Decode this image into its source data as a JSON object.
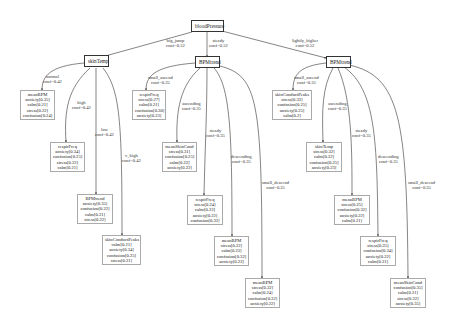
{
  "diagram": {
    "root": {
      "id": "n0",
      "label": "bloodPressure"
    },
    "internal_nodes": [
      {
        "id": "n1",
        "label": "skinTemp"
      },
      {
        "id": "n2",
        "label": "BPMtrend"
      },
      {
        "id": "n3",
        "label": "BPMtrend"
      }
    ],
    "leaves": [
      {
        "id": "l1",
        "title": "meanBPM",
        "rows": [
          "anxiety[0.35]",
          "calm[0.21]",
          "stress[0.22]",
          "confusion[0.24]"
        ]
      },
      {
        "id": "l2",
        "title": "respirFreq",
        "rows": [
          "anxiety[0.34]",
          "confusion[0.25]",
          "stress[0.22]",
          "calm[0.21]"
        ]
      },
      {
        "id": "l3",
        "title": "BPMtrend",
        "rows": [
          "anxiety[0.35]",
          "confusion[0.22]",
          "calm[0.21]",
          "stress[0.22]"
        ]
      },
      {
        "id": "l4",
        "title": "skinConductPeaks",
        "rows": [
          "calm[0.21]",
          "anxiety[0.34]",
          "confusion[0.25]",
          "stress[0.21]"
        ]
      },
      {
        "id": "l5",
        "title": "respirFreq",
        "rows": [
          "stress[0.27]",
          "calm[0.21]",
          "confusion[0.30]",
          "anxiety[0.23]"
        ]
      },
      {
        "id": "l6",
        "title": "meanSkinCond",
        "rows": [
          "stress[0.31]",
          "confusion[0.25]",
          "calm[0.22]",
          "anxiety[0.22]"
        ]
      },
      {
        "id": "l7",
        "title": "respirFreq",
        "rows": [
          "stress[0.24]",
          "calm[0.23]",
          "anxiety[0.22]",
          "confusion[0.32]"
        ]
      },
      {
        "id": "l8",
        "title": "meanBPM",
        "rows": [
          "stress[0.22]",
          "calm[0.23]",
          "confusion[0.32]",
          "anxiety[0.23]"
        ]
      },
      {
        "id": "l9",
        "title": "meanBPM",
        "rows": [
          "stress[0.32]",
          "calm[0.24]",
          "confusion[0.32]",
          "anxiety[0.22]"
        ]
      },
      {
        "id": "l10",
        "title": "skinConductPeaks",
        "rows": [
          "stress[0.32]",
          "confusion[0.25]",
          "anxiety[0.25]",
          "calm[0.2]"
        ]
      },
      {
        "id": "l11",
        "title": "skinTemp",
        "rows": [
          "stress[0.32]",
          "calm[0.22]",
          "confusion[0.25]",
          "anxiety[0.23]"
        ]
      },
      {
        "id": "l12",
        "title": "meanBPM",
        "rows": [
          "stress[0.25]",
          "confusion[0.32]",
          "anxiety[0.22]",
          "calm[0.21]"
        ]
      },
      {
        "id": "l13",
        "title": "respirFreq",
        "rows": [
          "stress[0.25]",
          "confusion[0.34]",
          "anxiety[0.22]",
          "calm[0.21]"
        ]
      },
      {
        "id": "l14",
        "title": "meanSkinCond",
        "rows": [
          "confusion[0.35]",
          "calm[0.21]",
          "stress[0.22]",
          "anxiety[0.35]"
        ]
      }
    ],
    "edges": [
      {
        "from": "n0",
        "to": "n1",
        "label": "big_jump",
        "conf": "conf=0.52"
      },
      {
        "from": "n0",
        "to": "n2",
        "label": "steady",
        "conf": "conf=0.52"
      },
      {
        "from": "n0",
        "to": "n3",
        "label": "lightly_higher",
        "conf": "conf=0.52"
      },
      {
        "from": "n1",
        "to": "l1",
        "label": "normal",
        "conf": "conf=0.42"
      },
      {
        "from": "n1",
        "to": "l2",
        "label": "high",
        "conf": "conf=0.42"
      },
      {
        "from": "n1",
        "to": "l3",
        "label": "low",
        "conf": "conf=0.42"
      },
      {
        "from": "n1",
        "to": "l4",
        "label": "v_high",
        "conf": "conf=0.42"
      },
      {
        "from": "n2",
        "to": "l5",
        "label": "small_ascend",
        "conf": "conf=0.35"
      },
      {
        "from": "n2",
        "to": "l6",
        "label": "ascending",
        "conf": "conf=0.35"
      },
      {
        "from": "n2",
        "to": "l7",
        "label": "steady",
        "conf": "conf=0.35"
      },
      {
        "from": "n2",
        "to": "l8",
        "label": "descending",
        "conf": "conf=0.35"
      },
      {
        "from": "n2",
        "to": "l9",
        "label": "small_descend",
        "conf": "conf=0.35"
      },
      {
        "from": "n3",
        "to": "l10",
        "label": "small_ascend",
        "conf": "conf=0.35"
      },
      {
        "from": "n3",
        "to": "l11",
        "label": "ascending",
        "conf": "conf=0.35"
      },
      {
        "from": "n3",
        "to": "l12",
        "label": "steady",
        "conf": "conf=0.35"
      },
      {
        "from": "n3",
        "to": "l13",
        "label": "descending",
        "conf": "conf=0.35"
      },
      {
        "from": "n3",
        "to": "l14",
        "label": "small_descend",
        "conf": "conf=0.35"
      }
    ]
  }
}
